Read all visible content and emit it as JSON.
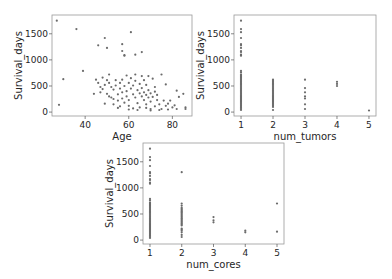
{
  "chart_data": [
    {
      "type": "scatter",
      "title": "",
      "xlabel": "Age",
      "ylabel": "Survival_days",
      "xticks": [
        40,
        60,
        80
      ],
      "yticks": [
        0,
        500,
        1000,
        1500
      ],
      "xlim": [
        24.8,
        89
      ],
      "ylim": [
        -75,
        1860
      ],
      "grid": false,
      "legend": null,
      "box": {
        "left": 52,
        "top": 15,
        "right": 192,
        "bottom": 116
      },
      "points": [
        [
          27,
          1750
        ],
        [
          28,
          140
        ],
        [
          30,
          630
        ],
        [
          36,
          1590
        ],
        [
          39,
          790
        ],
        [
          46,
          1280
        ],
        [
          49,
          1420
        ],
        [
          50,
          1230
        ],
        [
          57,
          1300
        ],
        [
          57,
          1170
        ],
        [
          58,
          1090
        ],
        [
          61,
          1530
        ],
        [
          63,
          1100
        ],
        [
          66,
          1150
        ],
        [
          58,
          1080
        ],
        [
          44,
          350
        ],
        [
          45,
          620
        ],
        [
          46,
          560
        ],
        [
          47,
          480
        ],
        [
          47,
          380
        ],
        [
          48,
          660
        ],
        [
          48,
          440
        ],
        [
          49,
          520
        ],
        [
          50,
          350
        ],
        [
          50,
          610
        ],
        [
          51,
          720
        ],
        [
          51,
          560
        ],
        [
          52,
          480
        ],
        [
          52,
          280
        ],
        [
          53,
          430
        ],
        [
          53,
          150
        ],
        [
          54,
          610
        ],
        [
          54,
          510
        ],
        [
          55,
          340
        ],
        [
          55,
          220
        ],
        [
          55,
          80
        ],
        [
          56,
          560
        ],
        [
          56,
          450
        ],
        [
          57,
          620
        ],
        [
          57,
          380
        ],
        [
          57,
          260
        ],
        [
          58,
          500
        ],
        [
          58,
          180
        ],
        [
          59,
          400
        ],
        [
          59,
          700
        ],
        [
          59,
          300
        ],
        [
          60,
          560
        ],
        [
          60,
          230
        ],
        [
          60,
          120
        ],
        [
          61,
          450
        ],
        [
          61,
          650
        ],
        [
          62,
          340
        ],
        [
          62,
          510
        ],
        [
          62,
          70
        ],
        [
          63,
          720
        ],
        [
          63,
          280
        ],
        [
          63,
          600
        ],
        [
          64,
          170
        ],
        [
          64,
          420
        ],
        [
          65,
          360
        ],
        [
          65,
          540
        ],
        [
          65,
          90
        ],
        [
          66,
          690
        ],
        [
          66,
          300
        ],
        [
          66,
          460
        ],
        [
          67,
          230
        ],
        [
          67,
          380
        ],
        [
          67,
          610
        ],
        [
          68,
          330
        ],
        [
          68,
          150
        ],
        [
          68,
          520
        ],
        [
          69,
          280
        ],
        [
          69,
          420
        ],
        [
          69,
          690
        ],
        [
          70,
          200
        ],
        [
          70,
          360
        ],
        [
          70,
          60
        ],
        [
          71,
          640
        ],
        [
          71,
          290
        ],
        [
          72,
          110
        ],
        [
          72,
          480
        ],
        [
          72,
          390
        ],
        [
          73,
          230
        ],
        [
          73,
          330
        ],
        [
          74,
          150
        ],
        [
          75,
          720
        ],
        [
          75,
          60
        ],
        [
          76,
          220
        ],
        [
          77,
          530
        ],
        [
          77,
          120
        ],
        [
          78,
          160
        ],
        [
          79,
          220
        ],
        [
          80,
          90
        ],
        [
          81,
          130
        ],
        [
          82,
          410
        ],
        [
          82,
          60
        ],
        [
          83,
          290
        ],
        [
          85,
          350
        ],
        [
          86,
          60
        ],
        [
          86,
          90
        ],
        [
          49,
          160
        ],
        [
          51,
          300
        ],
        [
          53,
          250
        ],
        [
          56,
          110
        ],
        [
          60,
          50
        ],
        [
          64,
          40
        ],
        [
          68,
          80
        ],
        [
          70,
          30
        ],
        [
          74,
          40
        ],
        [
          78,
          50
        ]
      ]
    },
    {
      "type": "scatter",
      "title": "",
      "xlabel": "num_tumors",
      "ylabel": "Survival_days",
      "xticks": [
        1,
        2,
        3,
        4,
        5
      ],
      "yticks": [
        0,
        500,
        1000,
        1500
      ],
      "xlim": [
        0.78,
        5.22
      ],
      "ylim": [
        -75,
        1860
      ],
      "grid": false,
      "legend": null,
      "box": {
        "left": 234,
        "top": 15,
        "right": 376,
        "bottom": 116
      },
      "points": [
        [
          1,
          1750
        ],
        [
          1,
          1590
        ],
        [
          1,
          1530
        ],
        [
          1,
          1420
        ],
        [
          1,
          1300
        ],
        [
          1,
          1280
        ],
        [
          1,
          1230
        ],
        [
          1,
          1170
        ],
        [
          1,
          1150
        ],
        [
          1,
          1100
        ],
        [
          1,
          1090
        ],
        [
          1,
          1080
        ],
        [
          1,
          790
        ],
        [
          1,
          760
        ],
        [
          1,
          720
        ],
        [
          1,
          700
        ],
        [
          1,
          680
        ],
        [
          1,
          660
        ],
        [
          1,
          640
        ],
        [
          1,
          620
        ],
        [
          1,
          600
        ],
        [
          1,
          580
        ],
        [
          1,
          560
        ],
        [
          1,
          540
        ],
        [
          1,
          520
        ],
        [
          1,
          500
        ],
        [
          1,
          480
        ],
        [
          1,
          460
        ],
        [
          1,
          440
        ],
        [
          1,
          420
        ],
        [
          1,
          400
        ],
        [
          1,
          380
        ],
        [
          1,
          360
        ],
        [
          1,
          340
        ],
        [
          1,
          320
        ],
        [
          1,
          300
        ],
        [
          1,
          280
        ],
        [
          1,
          260
        ],
        [
          1,
          240
        ],
        [
          1,
          220
        ],
        [
          1,
          200
        ],
        [
          1,
          180
        ],
        [
          1,
          160
        ],
        [
          1,
          140
        ],
        [
          1,
          120
        ],
        [
          1,
          100
        ],
        [
          1,
          80
        ],
        [
          1,
          60
        ],
        [
          1,
          40
        ],
        [
          2,
          620
        ],
        [
          2,
          600
        ],
        [
          2,
          580
        ],
        [
          2,
          560
        ],
        [
          2,
          540
        ],
        [
          2,
          520
        ],
        [
          2,
          500
        ],
        [
          2,
          480
        ],
        [
          2,
          460
        ],
        [
          2,
          440
        ],
        [
          2,
          420
        ],
        [
          2,
          400
        ],
        [
          2,
          380
        ],
        [
          2,
          360
        ],
        [
          2,
          340
        ],
        [
          2,
          320
        ],
        [
          2,
          300
        ],
        [
          2,
          280
        ],
        [
          2,
          260
        ],
        [
          2,
          240
        ],
        [
          2,
          220
        ],
        [
          2,
          200
        ],
        [
          2,
          180
        ],
        [
          2,
          160
        ],
        [
          2,
          140
        ],
        [
          2,
          120
        ],
        [
          2,
          100
        ],
        [
          2,
          40
        ],
        [
          3,
          620
        ],
        [
          3,
          460
        ],
        [
          3,
          380
        ],
        [
          3,
          300
        ],
        [
          3,
          260
        ],
        [
          3,
          150
        ],
        [
          3,
          60
        ],
        [
          4,
          580
        ],
        [
          4,
          540
        ],
        [
          4,
          500
        ],
        [
          5,
          30
        ]
      ]
    },
    {
      "type": "scatter",
      "title": "",
      "xlabel": "num_cores",
      "ylabel": "Survival_days",
      "xticks": [
        1,
        2,
        3,
        4,
        5
      ],
      "yticks": [
        0,
        500,
        1000,
        1500
      ],
      "xlim": [
        0.78,
        5.22
      ],
      "ylim": [
        -75,
        1860
      ],
      "grid": false,
      "legend": null,
      "box": {
        "left": 143,
        "top": 143,
        "right": 284,
        "bottom": 244
      },
      "points": [
        [
          1,
          1750
        ],
        [
          1,
          1590
        ],
        [
          1,
          1530
        ],
        [
          1,
          1420
        ],
        [
          1,
          1300
        ],
        [
          1,
          1280
        ],
        [
          1,
          1230
        ],
        [
          1,
          1170
        ],
        [
          1,
          1150
        ],
        [
          1,
          1100
        ],
        [
          1,
          1080
        ],
        [
          1,
          790
        ],
        [
          1,
          760
        ],
        [
          1,
          720
        ],
        [
          1,
          700
        ],
        [
          1,
          680
        ],
        [
          1,
          660
        ],
        [
          1,
          640
        ],
        [
          1,
          620
        ],
        [
          1,
          600
        ],
        [
          1,
          580
        ],
        [
          1,
          560
        ],
        [
          1,
          540
        ],
        [
          1,
          520
        ],
        [
          1,
          500
        ],
        [
          1,
          480
        ],
        [
          1,
          460
        ],
        [
          1,
          440
        ],
        [
          1,
          420
        ],
        [
          1,
          400
        ],
        [
          1,
          380
        ],
        [
          1,
          360
        ],
        [
          1,
          340
        ],
        [
          1,
          320
        ],
        [
          1,
          300
        ],
        [
          1,
          280
        ],
        [
          1,
          260
        ],
        [
          1,
          240
        ],
        [
          1,
          220
        ],
        [
          1,
          200
        ],
        [
          1,
          180
        ],
        [
          1,
          160
        ],
        [
          1,
          140
        ],
        [
          1,
          120
        ],
        [
          1,
          100
        ],
        [
          1,
          80
        ],
        [
          1,
          60
        ],
        [
          1,
          40
        ],
        [
          2,
          1300
        ],
        [
          2,
          700
        ],
        [
          2,
          660
        ],
        [
          2,
          620
        ],
        [
          2,
          600
        ],
        [
          2,
          580
        ],
        [
          2,
          560
        ],
        [
          2,
          540
        ],
        [
          2,
          520
        ],
        [
          2,
          500
        ],
        [
          2,
          480
        ],
        [
          2,
          460
        ],
        [
          2,
          440
        ],
        [
          2,
          420
        ],
        [
          2,
          400
        ],
        [
          2,
          380
        ],
        [
          2,
          360
        ],
        [
          2,
          340
        ],
        [
          2,
          320
        ],
        [
          2,
          300
        ],
        [
          2,
          280
        ],
        [
          2,
          220
        ],
        [
          2,
          200
        ],
        [
          2,
          180
        ],
        [
          2,
          150
        ],
        [
          2,
          100
        ],
        [
          2,
          60
        ],
        [
          3,
          440
        ],
        [
          3,
          380
        ],
        [
          3,
          340
        ],
        [
          4,
          180
        ],
        [
          4,
          150
        ],
        [
          5,
          700
        ],
        [
          5,
          160
        ]
      ]
    }
  ]
}
